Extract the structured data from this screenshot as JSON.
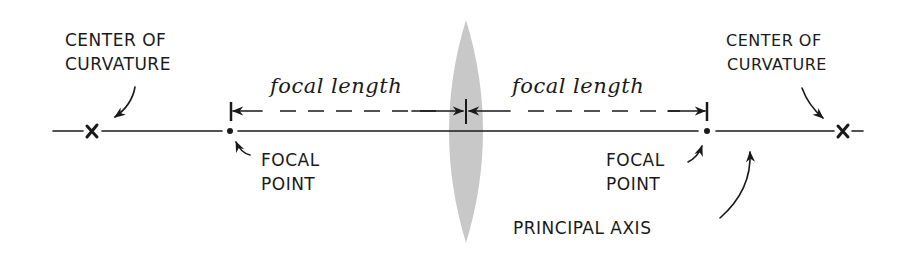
{
  "diagram": {
    "type": "converging-lens-diagram",
    "colors": {
      "ink": "#1a1a1a",
      "lens_fill": "#c8c8c8",
      "background": "#ffffff"
    },
    "labels": {
      "center_left_line1": "CENTER OF",
      "center_left_line2": "CURVATURE",
      "center_right_line1": "CENTER OF",
      "center_right_line2": "CURVATURE",
      "focal_length_left": "focal length",
      "focal_length_right": "focal length",
      "focal_point_left_line1": "FOCAL",
      "focal_point_left_line2": "POINT",
      "focal_point_right_line1": "FOCAL",
      "focal_point_right_line2": "POINT",
      "principal_axis": "PRINCIPAL AXIS"
    },
    "markers": {
      "center_of_curvature_symbol": "x",
      "focal_point_symbol": "•"
    }
  }
}
